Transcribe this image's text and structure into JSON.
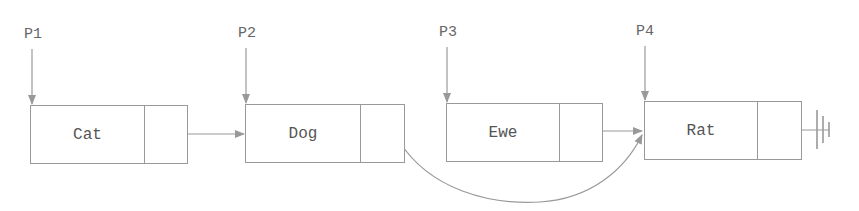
{
  "diagram": {
    "type": "singly-linked-list",
    "pointers": [
      {
        "label": "P1",
        "target": "Cat"
      },
      {
        "label": "P2",
        "target": "Dog"
      },
      {
        "label": "P3",
        "target": "Ewe"
      },
      {
        "label": "P4",
        "target": "Rat"
      }
    ],
    "nodes": [
      {
        "value": "Cat",
        "next": "Dog"
      },
      {
        "value": "Dog",
        "next": "Rat"
      },
      {
        "value": "Ewe",
        "next": "Rat"
      },
      {
        "value": "Rat",
        "next": "null"
      }
    ],
    "terminator_icon": "ground-null-icon",
    "colors": {
      "line": "#999999",
      "text": "#555555"
    }
  }
}
